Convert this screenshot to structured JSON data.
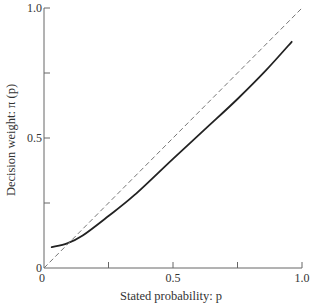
{
  "chart_data": {
    "type": "line",
    "title": "",
    "xlabel": "Stated probability: p",
    "ylabel": "Decision weight: π (p)",
    "xlim": [
      0,
      1.0
    ],
    "ylim": [
      0,
      1.0
    ],
    "x_ticks": [
      0,
      0.25,
      0.5,
      0.75,
      1.0
    ],
    "x_tick_labels": [
      "0",
      "",
      "0.5",
      "",
      "1.0"
    ],
    "y_ticks": [
      0,
      0.25,
      0.5,
      0.75,
      1.0
    ],
    "y_tick_labels": [
      "0",
      "",
      "0.5",
      "",
      "1.0"
    ],
    "grid": false,
    "legend": null,
    "series": [
      {
        "name": "Decision weight π(p)",
        "style": "solid",
        "color": "#222222",
        "x": [
          0.03,
          0.09,
          0.15,
          0.25,
          0.35,
          0.5,
          0.62,
          0.75,
          0.86,
          0.96
        ],
        "values": [
          0.08,
          0.095,
          0.125,
          0.2,
          0.28,
          0.42,
          0.53,
          0.65,
          0.76,
          0.87
        ]
      },
      {
        "name": "Identity (π = p)",
        "style": "dashed",
        "color": "#777777",
        "x": [
          0,
          1.0
        ],
        "values": [
          0,
          1.0
        ]
      }
    ]
  }
}
